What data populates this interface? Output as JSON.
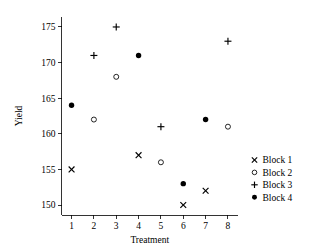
{
  "chart_data": {
    "type": "scatter",
    "title": "",
    "xlabel": "Treatment",
    "ylabel": "Yield",
    "xlim": [
      0.55,
      8.45
    ],
    "ylim": [
      148.6,
      176.4
    ],
    "xticks": [
      1,
      2,
      3,
      4,
      5,
      6,
      7,
      8
    ],
    "yticks": [
      150,
      155,
      160,
      165,
      170,
      175
    ],
    "grid": false,
    "legend_position": "right",
    "series": [
      {
        "name": "Block 1",
        "marker": "cross",
        "color": "#000000",
        "x": [
          1,
          4,
          6,
          7
        ],
        "y": [
          155,
          157,
          150,
          152
        ]
      },
      {
        "name": "Block 2",
        "marker": "open-circle",
        "color": "#000000",
        "x": [
          2,
          3,
          5,
          8
        ],
        "y": [
          162,
          168,
          156,
          161
        ]
      },
      {
        "name": "Block 3",
        "marker": "plus",
        "color": "#000000",
        "x": [
          2,
          3,
          5,
          8
        ],
        "y": [
          171,
          175,
          161,
          173
        ]
      },
      {
        "name": "Block 4",
        "marker": "filled-circle",
        "color": "#000000",
        "x": [
          1,
          4,
          6,
          7
        ],
        "y": [
          164,
          171,
          153,
          162
        ]
      }
    ]
  },
  "legend": {
    "entries": [
      {
        "label": "Block 1",
        "marker": "cross"
      },
      {
        "label": "Block 2",
        "marker": "open-circle"
      },
      {
        "label": "Block 3",
        "marker": "plus"
      },
      {
        "label": "Block 4",
        "marker": "filled-circle"
      }
    ]
  },
  "axes": {
    "x_title": "Treatment",
    "y_title": "Yield",
    "x_tick_labels": [
      "1",
      "2",
      "3",
      "4",
      "5",
      "6",
      "7",
      "8"
    ],
    "y_tick_labels": [
      "150",
      "155",
      "160",
      "165",
      "170",
      "175"
    ]
  }
}
